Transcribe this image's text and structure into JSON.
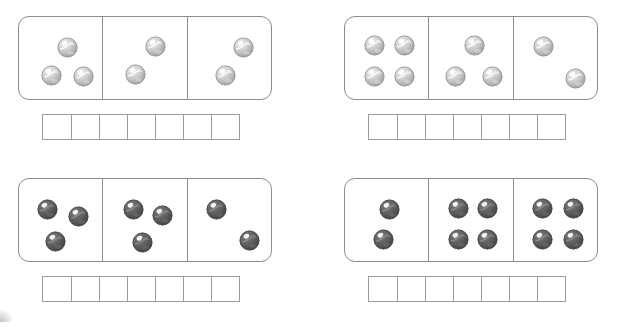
{
  "worksheet": {
    "title": "Domino marble counting worksheet",
    "marble_styles": {
      "light": {
        "name": "light-gray-swirl-marble",
        "body_light": "#f2f2f2",
        "body_mid": "#c9c9c9",
        "body_dark": "#9a9a9a",
        "outline": "#8a8a8a",
        "swirl": "#ffffff",
        "highlight": "#ffffff"
      },
      "dark": {
        "name": "dark-gray-swirl-marble",
        "body_light": "#7e7e7e",
        "body_mid": "#5e5e5e",
        "body_dark": "#3f3f3f",
        "outline": "#3a3a3a",
        "swirl": "#8f8f8f",
        "highlight": "#ffffff"
      }
    },
    "frame_color": "#8d8d8d",
    "grid_color": "#9b9b9b",
    "answer_cells_per_grid": 7,
    "problems": [
      {
        "id": "problem-1",
        "marble_style": "light",
        "cell_counts": [
          3,
          2,
          2
        ],
        "total": 7,
        "answer_cells": [
          "",
          "",
          "",
          "",
          "",
          "",
          ""
        ],
        "cells": [
          {
            "id": "domino-cell-1-1",
            "count": 3,
            "marbles": [
              {
                "x": 48,
                "y": 30
              },
              {
                "x": 32,
                "y": 58
              },
              {
                "x": 64,
                "y": 59
              }
            ]
          },
          {
            "id": "domino-cell-1-2",
            "count": 2,
            "marbles": [
              {
                "x": 52,
                "y": 29
              },
              {
                "x": 32,
                "y": 57
              }
            ]
          },
          {
            "id": "domino-cell-1-3",
            "count": 2,
            "marbles": [
              {
                "x": 56,
                "y": 30
              },
              {
                "x": 38,
                "y": 58
              }
            ]
          }
        ]
      },
      {
        "id": "problem-2",
        "marble_style": "light",
        "cell_counts": [
          4,
          3,
          2
        ],
        "total": 9,
        "answer_cells": [
          "",
          "",
          "",
          "",
          "",
          "",
          ""
        ],
        "cells": [
          {
            "id": "domino-cell-2-1",
            "count": 4,
            "marbles": [
              {
                "x": 29,
                "y": 28
              },
              {
                "x": 59,
                "y": 28
              },
              {
                "x": 29,
                "y": 59
              },
              {
                "x": 59,
                "y": 59
              }
            ]
          },
          {
            "id": "domino-cell-2-2",
            "count": 3,
            "marbles": [
              {
                "x": 45,
                "y": 28
              },
              {
                "x": 26,
                "y": 59
              },
              {
                "x": 63,
                "y": 59
              }
            ]
          },
          {
            "id": "domino-cell-2-3",
            "count": 2,
            "marbles": [
              {
                "x": 30,
                "y": 29
              },
              {
                "x": 62,
                "y": 61
              }
            ]
          }
        ]
      },
      {
        "id": "problem-3",
        "marble_style": "dark",
        "cell_counts": [
          3,
          3,
          2
        ],
        "total": 8,
        "answer_cells": [
          "",
          "",
          "",
          "",
          "",
          "",
          ""
        ],
        "cells": [
          {
            "id": "domino-cell-3-1",
            "count": 3,
            "marbles": [
              {
                "x": 28,
                "y": 30
              },
              {
                "x": 59,
                "y": 37
              },
              {
                "x": 36,
                "y": 62
              }
            ]
          },
          {
            "id": "domino-cell-3-2",
            "count": 3,
            "marbles": [
              {
                "x": 30,
                "y": 30
              },
              {
                "x": 59,
                "y": 36
              },
              {
                "x": 39,
                "y": 63
              }
            ]
          },
          {
            "id": "domino-cell-3-3",
            "count": 2,
            "marbles": [
              {
                "x": 29,
                "y": 30
              },
              {
                "x": 62,
                "y": 61
              }
            ]
          }
        ]
      },
      {
        "id": "problem-4",
        "marble_style": "dark",
        "cell_counts": [
          2,
          4,
          4
        ],
        "total": 10,
        "answer_cells": [
          "",
          "",
          "",
          "",
          "",
          "",
          ""
        ],
        "cells": [
          {
            "id": "domino-cell-4-1",
            "count": 2,
            "marbles": [
              {
                "x": 44,
                "y": 30
              },
              {
                "x": 38,
                "y": 60
              }
            ]
          },
          {
            "id": "domino-cell-4-2",
            "count": 4,
            "marbles": [
              {
                "x": 29,
                "y": 29
              },
              {
                "x": 58,
                "y": 29
              },
              {
                "x": 29,
                "y": 60
              },
              {
                "x": 58,
                "y": 60
              }
            ]
          },
          {
            "id": "domino-cell-4-3",
            "count": 4,
            "marbles": [
              {
                "x": 29,
                "y": 29
              },
              {
                "x": 60,
                "y": 29
              },
              {
                "x": 29,
                "y": 60
              },
              {
                "x": 60,
                "y": 60
              }
            ]
          }
        ]
      }
    ]
  }
}
